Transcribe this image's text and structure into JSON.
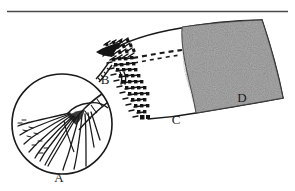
{
  "figure": {
    "caption": "",
    "background_color": "#ffffff",
    "ink_color": "#1a1a1a",
    "shade_color": "#8a8a8a",
    "rule_color": "#4a4a4a"
  },
  "divider": {
    "name": "horizontal-rule",
    "y": 11,
    "x_start": 7,
    "x_end": 288
  },
  "labels": [
    {
      "id": "A",
      "text": "A",
      "x": 59,
      "y": 182,
      "describes": "magnified-inset-detail"
    },
    {
      "id": "B",
      "text": "B",
      "x": 105,
      "y": 84,
      "describes": "fringe-attachment-point"
    },
    {
      "id": "C",
      "text": "C",
      "x": 176,
      "y": 124,
      "describes": "lower-membrane-margin"
    },
    {
      "id": "D",
      "text": "D",
      "x": 242,
      "y": 102,
      "describes": "shaded-membrane-region"
    }
  ],
  "parts": [
    {
      "name": "magnifier-circle",
      "shape": "circle",
      "cx": 62,
      "cy": 124,
      "r": 50
    },
    {
      "name": "wing-membrane",
      "shape": "quadrilateral-curved"
    },
    {
      "name": "fringe-band",
      "shape": "checkered-saw-band"
    },
    {
      "name": "dashed-vein",
      "shape": "dashed-line"
    },
    {
      "name": "stippled-region",
      "shape": "textured-fill",
      "label_ref": "D"
    }
  ],
  "legend": {
    "present": false,
    "items": []
  }
}
